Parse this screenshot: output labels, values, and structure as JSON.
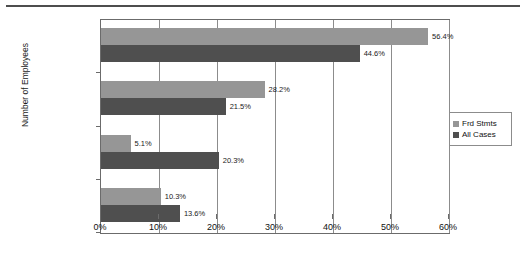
{
  "chart_data": {
    "type": "bar",
    "orientation": "horizontal",
    "title": "",
    "xlabel": "",
    "ylabel": "Number of Employees",
    "categories": [
      "1 - 99",
      "100 - 999",
      "1,000 - 9,999",
      "10,000+"
    ],
    "series": [
      {
        "name": "Frd Stmts",
        "color": "#969696",
        "values": [
          56.4,
          28.2,
          5.1,
          10.3
        ],
        "labels": [
          "56.4%",
          "28.2%",
          "5.1%",
          "10.3%"
        ]
      },
      {
        "name": "All Cases",
        "color": "#4f4f4f",
        "values": [
          44.6,
          21.5,
          20.3,
          13.6
        ],
        "labels": [
          "44.6%",
          "21.5%",
          "20.3%",
          "13.6%"
        ]
      }
    ],
    "xlim": [
      0,
      60
    ],
    "xticks": [
      0,
      10,
      20,
      30,
      40,
      50,
      60
    ],
    "xtick_labels": [
      "0%",
      "10%",
      "20%",
      "30%",
      "40%",
      "50%",
      "60%"
    ],
    "grid": true,
    "legend_position": "right"
  },
  "legend": {
    "items": [
      {
        "label": "Frd Stmts",
        "color": "#969696"
      },
      {
        "label": "All Cases",
        "color": "#4f4f4f"
      }
    ]
  }
}
